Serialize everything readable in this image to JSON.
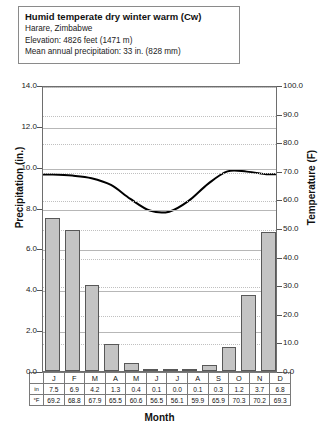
{
  "info": {
    "title": "Humid temperate dry winter warm (Cw)",
    "location": "Harare, Zimbabwe",
    "elevation": "Elevation: 4826 feet (1471 m)",
    "precipitation": "Mean annual precipitation: 33 in. (828 mm)"
  },
  "axes": {
    "left_label": "Precipitation (in.)",
    "right_label": "Temperature (F)",
    "x_label": "Month",
    "left_ticks": [
      "14.0",
      "12.0",
      "10.0",
      "8.0",
      "6.0",
      "4.0",
      "2.0",
      "0.0"
    ],
    "right_ticks": [
      "100.0",
      "90.0",
      "80.0",
      "70.0",
      "60.0",
      "50.0",
      "40.0",
      "30.0",
      "20.0",
      "10.0",
      "0.0"
    ]
  },
  "table": {
    "precip_row_label": "in",
    "temp_row_label": "°F"
  },
  "chart_data": {
    "type": "bar",
    "title": "Humid temperate dry winter warm (Cw)",
    "subtitle": "Harare, Zimbabwe",
    "xlabel": "Month",
    "ylabel": "Precipitation (in.)",
    "y2label": "Temperature (F)",
    "ylim": [
      0,
      14
    ],
    "y2lim": [
      0,
      100
    ],
    "ytick_step": 2,
    "y2tick_step": 10,
    "grid": true,
    "legend": "none",
    "categories": [
      "J",
      "F",
      "M",
      "A",
      "M",
      "J",
      "J",
      "A",
      "S",
      "O",
      "N",
      "D"
    ],
    "series": [
      {
        "name": "Precipitation (in.)",
        "type": "bar",
        "axis": "left",
        "values": [
          7.5,
          6.9,
          4.2,
          1.3,
          0.4,
          0.1,
          0.0,
          0.1,
          0.3,
          1.2,
          3.7,
          6.8
        ]
      },
      {
        "name": "Temperature (F)",
        "type": "line",
        "axis": "right",
        "values": [
          69.2,
          68.8,
          67.9,
          65.5,
          60.6,
          56.5,
          56.1,
          59.9,
          65.9,
          70.3,
          70.2,
          69.3
        ]
      }
    ]
  }
}
